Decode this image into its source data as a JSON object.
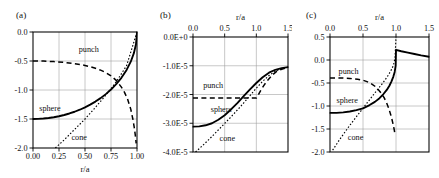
{
  "figure": {
    "panel_a_label": "(a)",
    "panel_b_label": "(b)",
    "panel_c_label": "(c)"
  },
  "chart_data": [
    {
      "type": "line",
      "panel": "(a)",
      "title": "",
      "xlabel": "r/a",
      "ylabel": "",
      "xlim": [
        0.0,
        1.0
      ],
      "ylim": [
        0.0,
        -2.0
      ],
      "x_axis_position": "bottom",
      "y_axis_inverted": true,
      "grid": true,
      "xticks": [
        "0.00",
        "0.25",
        "0.50",
        "0.75",
        "1.00"
      ],
      "xtick_values": [
        0.0,
        0.25,
        0.5,
        0.75,
        1.0
      ],
      "yticks": [
        "-2.0",
        "-1.5",
        "-1.0",
        "-0.5",
        "0.0"
      ],
      "ytick_values": [
        -2.0,
        -1.5,
        -1.0,
        -0.5,
        0.0
      ],
      "legend_position": "inline-annotations",
      "series": [
        {
          "name": "sphere",
          "style": "solid",
          "label_x": 0.06,
          "label_y": -1.37,
          "x": [
            0.0,
            0.05,
            0.1,
            0.15,
            0.2,
            0.25,
            0.3,
            0.35,
            0.4,
            0.45,
            0.5,
            0.55,
            0.6,
            0.65,
            0.7,
            0.75,
            0.8,
            0.85,
            0.9,
            0.94,
            0.97,
            0.99,
            1.0
          ],
          "values": [
            -1.5,
            -1.498,
            -1.492,
            -1.483,
            -1.47,
            -1.453,
            -1.431,
            -1.405,
            -1.375,
            -1.34,
            -1.299,
            -1.253,
            -1.2,
            -1.14,
            -1.071,
            -0.992,
            -0.9,
            -0.79,
            -0.654,
            -0.512,
            -0.365,
            -0.212,
            0.0
          ]
        },
        {
          "name": "punch",
          "style": "dashed",
          "label_x": 0.44,
          "label_y": -0.34,
          "x": [
            0.0,
            0.1,
            0.2,
            0.3,
            0.4,
            0.45,
            0.5,
            0.55,
            0.6,
            0.65,
            0.7,
            0.75,
            0.8,
            0.85,
            0.88,
            0.91,
            0.94,
            0.96,
            0.975,
            0.985,
            0.992
          ],
          "values": [
            -0.5,
            -0.502,
            -0.51,
            -0.524,
            -0.546,
            -0.559,
            -0.577,
            -0.598,
            -0.625,
            -0.658,
            -0.7,
            -0.756,
            -0.834,
            -0.95,
            -1.04,
            -1.16,
            -1.33,
            -1.5,
            -1.66,
            -1.8,
            -1.92
          ]
        },
        {
          "name": "cone",
          "style": "dotted",
          "label_x": 0.37,
          "label_y": -1.86,
          "x": [
            0.215,
            0.3,
            0.4,
            0.5,
            0.6,
            0.7,
            0.8,
            0.9,
            1.0
          ],
          "values": [
            -2.0,
            -1.86,
            -1.68,
            -1.5,
            -1.3,
            -1.09,
            -0.86,
            -0.58,
            0.0
          ]
        }
      ]
    },
    {
      "type": "line",
      "panel": "(b)",
      "title": "",
      "xlabel": "r/a",
      "ylabel": "",
      "xlim": [
        0.0,
        1.5
      ],
      "ylim": [
        0.0,
        -4.0
      ],
      "y_scale": "1e-5",
      "x_axis_position": "top",
      "y_axis_inverted": true,
      "grid": true,
      "xticks": [
        "0.0",
        "0.5",
        "1.0",
        "1.5"
      ],
      "xtick_values": [
        0.0,
        0.5,
        1.0,
        1.5
      ],
      "yticks": [
        "0.0E+0",
        "-1.0E-5",
        "-2.0E-5",
        "-3.0E-5",
        "-4.0E-5"
      ],
      "ytick_values": [
        0.0,
        -1.0,
        -2.0,
        -3.0,
        -4.0
      ],
      "legend_position": "inline-annotations",
      "series": [
        {
          "name": "punch",
          "style": "dashed",
          "label_x": 0.16,
          "label_y": -1.78,
          "x": [
            0.0,
            0.2,
            0.4,
            0.6,
            0.8,
            0.95,
            1.0,
            1.03,
            1.07,
            1.12,
            1.18,
            1.25,
            1.32,
            1.4,
            1.5
          ],
          "values": [
            -2.12,
            -2.12,
            -2.12,
            -2.12,
            -2.12,
            -2.12,
            -2.12,
            -2.02,
            -1.86,
            -1.68,
            -1.5,
            -1.33,
            -1.2,
            -1.12,
            -1.06
          ]
        },
        {
          "name": "sphere",
          "style": "solid",
          "label_x": 0.28,
          "label_y": -2.62,
          "x": [
            0.0,
            0.1,
            0.2,
            0.3,
            0.4,
            0.5,
            0.6,
            0.7,
            0.8,
            0.9,
            1.0,
            1.1,
            1.2,
            1.3,
            1.4,
            1.5
          ],
          "values": [
            -3.12,
            -3.11,
            -3.07,
            -3.0,
            -2.88,
            -2.72,
            -2.52,
            -2.3,
            -2.06,
            -1.82,
            -1.6,
            -1.4,
            -1.24,
            -1.14,
            -1.08,
            -1.05
          ]
        },
        {
          "name": "cone",
          "style": "dotted",
          "label_x": 0.42,
          "label_y": -3.62,
          "x": [
            0.04,
            0.15,
            0.3,
            0.45,
            0.6,
            0.75,
            0.9,
            1.0,
            1.1,
            1.2,
            1.3,
            1.4,
            1.5
          ],
          "values": [
            -4.0,
            -3.78,
            -3.46,
            -3.12,
            -2.78,
            -2.42,
            -2.04,
            -1.78,
            -1.54,
            -1.34,
            -1.19,
            -1.1,
            -1.05
          ]
        }
      ]
    },
    {
      "type": "line",
      "panel": "(c)",
      "title": "",
      "xlabel": "r/a",
      "ylabel": "",
      "xlim": [
        0.0,
        1.5
      ],
      "ylim": [
        0.5,
        -2.0
      ],
      "x_axis_position": "top",
      "y_axis_inverted": true,
      "grid": true,
      "xticks": [
        "0.0",
        "0.5",
        "1.0",
        "1.5"
      ],
      "xtick_values": [
        0.0,
        0.5,
        1.0,
        1.5
      ],
      "yticks": [
        "0.5",
        "0.0",
        "-0.5",
        "-1.0",
        "-1.5",
        "-2.0"
      ],
      "ytick_values": [
        0.5,
        0.0,
        -0.5,
        -1.0,
        -1.5,
        -2.0
      ],
      "legend_position": "inline-annotations",
      "series": [
        {
          "name": "punch",
          "style": "dashed",
          "label_x": 0.13,
          "label_y": -0.3,
          "x": [
            0.0,
            0.15,
            0.3,
            0.42,
            0.5,
            0.56,
            0.62,
            0.68,
            0.73,
            0.78,
            0.82,
            0.86,
            0.89,
            0.92,
            0.94,
            0.96,
            0.975,
            0.985
          ],
          "values": [
            -0.39,
            -0.39,
            -0.4,
            -0.42,
            -0.44,
            -0.47,
            -0.51,
            -0.57,
            -0.64,
            -0.73,
            -0.82,
            -0.94,
            -1.05,
            -1.19,
            -1.3,
            -1.42,
            -1.53,
            -1.62
          ]
        },
        {
          "name": "sphere",
          "style": "solid",
          "label_x": 0.1,
          "label_y": -0.93,
          "x": [
            0.0,
            0.1,
            0.2,
            0.3,
            0.4,
            0.5,
            0.6,
            0.68,
            0.75,
            0.81,
            0.86,
            0.9,
            0.93,
            0.96,
            0.98,
            0.995,
            1.0,
            1.0,
            1.08,
            1.18,
            1.28,
            1.38,
            1.5
          ],
          "values": [
            -1.15,
            -1.15,
            -1.14,
            -1.12,
            -1.09,
            -1.05,
            -0.98,
            -0.91,
            -0.83,
            -0.74,
            -0.65,
            -0.56,
            -0.47,
            -0.36,
            -0.26,
            -0.12,
            0.22,
            0.22,
            0.19,
            0.16,
            0.13,
            0.1,
            0.07
          ]
        },
        {
          "name": "cone",
          "style": "dotted",
          "label_x": 0.27,
          "label_y": -1.74,
          "x": [
            0.04,
            0.15,
            0.3,
            0.45,
            0.58,
            0.7,
            0.8,
            0.87,
            0.92,
            0.96,
            0.985,
            1.0
          ],
          "values": [
            -1.96,
            -1.72,
            -1.42,
            -1.14,
            -0.9,
            -0.68,
            -0.5,
            -0.36,
            -0.24,
            -0.12,
            0.04,
            0.5
          ]
        }
      ]
    }
  ]
}
